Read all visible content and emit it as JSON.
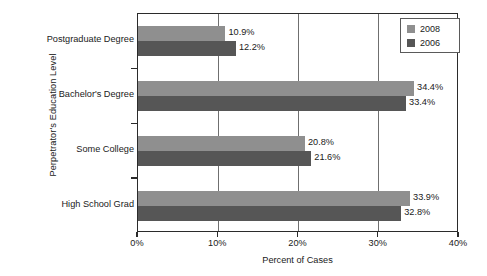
{
  "chart_data": {
    "type": "bar",
    "orientation": "horizontal",
    "title": "",
    "xlabel": "Percent of Cases",
    "ylabel": "Perpetrator's Education Level",
    "xlim": [
      0,
      40
    ],
    "xticks": [
      "0%",
      "10%",
      "20%",
      "30%",
      "40%"
    ],
    "xtick_values": [
      0,
      10,
      20,
      30,
      40
    ],
    "grid": "vertical",
    "legend_position": "top-right",
    "categories": [
      "Postgraduate Degree",
      "Bachelor's Degree",
      "Some College",
      "High School Grad"
    ],
    "series": [
      {
        "name": "2008",
        "color": "#8f8f8f",
        "values": [
          10.9,
          34.4,
          20.8,
          33.9
        ],
        "labels": [
          "10.9%",
          "34.4%",
          "20.8%",
          "33.9%"
        ]
      },
      {
        "name": "2006",
        "color": "#565656",
        "values": [
          12.2,
          33.4,
          21.6,
          32.8
        ],
        "labels": [
          "12.2%",
          "33.4%",
          "21.6%",
          "32.8%"
        ]
      }
    ]
  },
  "legend": {
    "entries": [
      {
        "label": "2008",
        "color": "#8f8f8f"
      },
      {
        "label": "2006",
        "color": "#565656"
      }
    ]
  },
  "colors": {
    "series_2008": "#8f8f8f",
    "series_2006": "#565656",
    "axis": "#2b2b2b",
    "gridline": "#6f6f6f",
    "background": "#ffffff",
    "text": "#1a1a1a"
  }
}
